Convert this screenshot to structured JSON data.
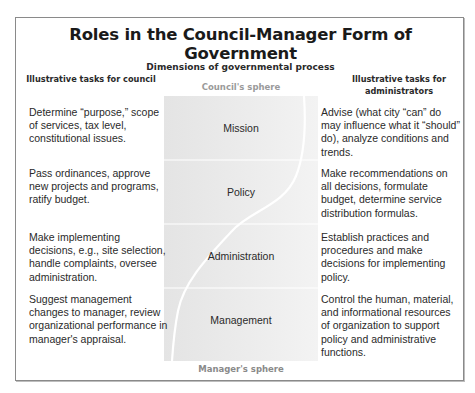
{
  "title": "Roles in the Council-Manager Form of Government",
  "subtitle": "Dimensions of governmental process",
  "columns": {
    "left_header": "Illustrative tasks for council",
    "right_header": "Illustrative tasks for administrators"
  },
  "spheres": {
    "top": "Council's sphere",
    "bottom": "Manager's sphere"
  },
  "stages": [
    {
      "label": "Mission",
      "council_task": "Determine “purpose,” scope of services, tax level, constitutional issues.",
      "admin_task": "Advise (what city “can” do may influence what it “should” do), analyze conditions and trends."
    },
    {
      "label": "Policy",
      "council_task": "Pass ordinances, approve new projects and programs, ratify budget.",
      "admin_task": "Make recommendations on all decisions, formulate budget, determine service distribution formulas."
    },
    {
      "label": "Administration",
      "council_task": "Make implementing decisions, e.g., site selection, handle complaints, oversee administration.",
      "admin_task": "Establish practices and procedures and make decisions for implementing policy."
    },
    {
      "label": "Management",
      "council_task": "Suggest management changes to manager, review organizational performance in manager's appraisal.",
      "admin_task": "Control the human, material, and informational resources of organization to support policy and administrative functions."
    }
  ],
  "colors": {
    "panel_gray": "#e8e8e8",
    "divider": "#ffffff",
    "curve": "#ffffff",
    "sphere_text": "#9a9a9a",
    "text": "#2a2a2a"
  }
}
